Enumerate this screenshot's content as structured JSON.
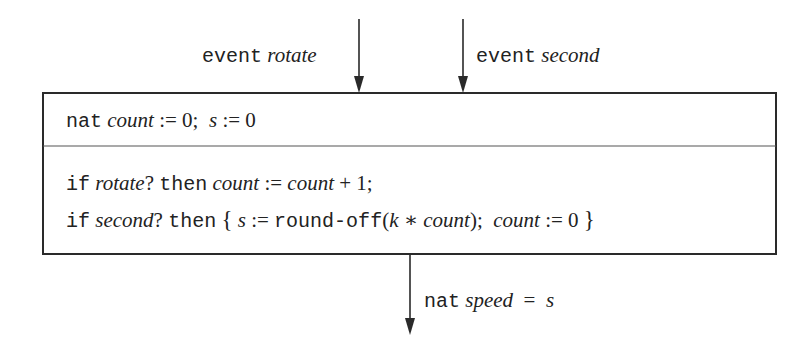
{
  "diagram": {
    "inputs": [
      {
        "keyword": "event",
        "name": "rotate"
      },
      {
        "keyword": "event",
        "name": "second"
      }
    ],
    "declaration": {
      "type": "nat",
      "var1": "count",
      "assign1": " := 0;  ",
      "var2": "s",
      "assign2": " := 0"
    },
    "body": {
      "line1": {
        "kw_if": "if",
        "cond": "rotate",
        "q": "?",
        "kw_then": "then",
        "lhs": "count",
        "op": " := ",
        "rhs": "count",
        "rest": " + 1;"
      },
      "line2": {
        "kw_if": "if",
        "cond": "second",
        "q": "?",
        "kw_then": "then",
        "open_brace": "{",
        "lhs": "s",
        "op": " := ",
        "func": "round-off",
        "paren_open": "(",
        "k": "k",
        "times": " ∗ ",
        "arg": "count",
        "paren_close": ");  ",
        "lhs2": "count",
        "assign2": " := 0 ",
        "close_brace": "}"
      }
    },
    "output": {
      "type": "nat",
      "name": "speed",
      "eq": "  =  ",
      "value": "s"
    },
    "colors": {
      "line": "#2a2a2a",
      "text": "#222222",
      "background": "#ffffff"
    }
  }
}
